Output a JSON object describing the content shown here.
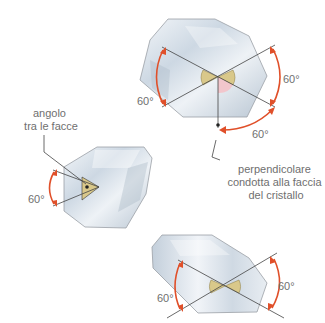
{
  "diagram": {
    "type": "crystal-interfacial-angles",
    "colors": {
      "arc": "#e0502a",
      "angle_fill": "#d9c88a",
      "angle_fill_pink": "#f2c6cc",
      "crystal_fill": "#dfe6ee",
      "crystal_edge": "#9aa0a6",
      "lines": "#444444",
      "text": "#6f6f6f"
    },
    "top_crystal": {
      "angle_labels": [
        "60°",
        "60°",
        "60°"
      ]
    },
    "left_crystal": {
      "callout": [
        "angolo",
        "tra le facce"
      ],
      "angle_labels": [
        "60°"
      ]
    },
    "perpendicular_callout": [
      "perpendicolare",
      "condotta alla faccia",
      "del cristallo"
    ],
    "bottom_crystal": {
      "angle_labels": [
        "60°",
        "60°"
      ]
    }
  }
}
